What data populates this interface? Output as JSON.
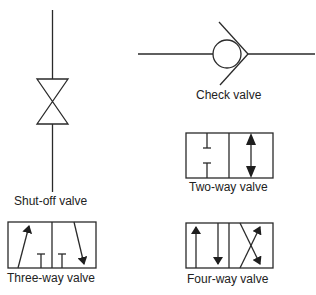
{
  "diagram": {
    "stroke_color": "#2a2a2a",
    "background": "#ffffff",
    "symbols": [
      {
        "id": "shutoff",
        "label": "Shut-off valve"
      },
      {
        "id": "check",
        "label": "Check valve"
      },
      {
        "id": "twoway",
        "label": "Two-way valve"
      },
      {
        "id": "threeway",
        "label": "Three-way valve"
      },
      {
        "id": "fourway",
        "label": "Four-way valve"
      }
    ]
  }
}
